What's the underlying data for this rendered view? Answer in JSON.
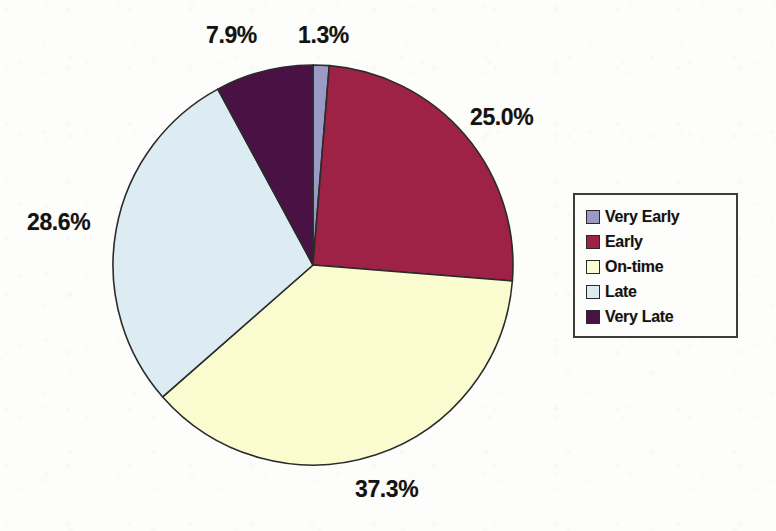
{
  "chart_data": {
    "type": "pie",
    "title": "",
    "subtitle": "",
    "xlabel": "",
    "ylabel": "",
    "legend_position": "right",
    "grid": false,
    "start_angle_deg": 0,
    "direction": "clockwise",
    "units": "percent",
    "categories": [
      "Very Early",
      "Early",
      "On-time",
      "Late",
      "Very Late"
    ],
    "values": [
      1.3,
      25.0,
      37.3,
      28.6,
      7.9
    ],
    "labels": [
      "1.3%",
      "25.0%",
      "37.3%",
      "28.6%",
      "7.9%"
    ],
    "colors": [
      "#9a9ac4",
      "#9e2245",
      "#fbfbd0",
      "#dcecf2",
      "#4a1145"
    ],
    "slices": [
      {
        "name": "Very Early",
        "value": 1.3,
        "label": "1.3%",
        "color": "#9a9ac4"
      },
      {
        "name": "Early",
        "value": 25.0,
        "label": "25.0%",
        "color": "#9e2245"
      },
      {
        "name": "On-time",
        "value": 37.3,
        "label": "37.3%",
        "color": "#fbfbd0"
      },
      {
        "name": "Late",
        "value": 28.6,
        "label": "28.6%",
        "color": "#dcecf2"
      },
      {
        "name": "Very Late",
        "value": 7.9,
        "label": "7.9%",
        "color": "#4a1145"
      }
    ],
    "geometry": {
      "cx": 313,
      "cy": 265,
      "r": 200
    },
    "label_positions": [
      {
        "label": "1.3%",
        "left": 298,
        "top": 22
      },
      {
        "label": "25.0%",
        "left": 470,
        "top": 104
      },
      {
        "label": "37.3%",
        "left": 355,
        "top": 476
      },
      {
        "label": "28.6%",
        "left": 27,
        "top": 209
      },
      {
        "label": "7.9%",
        "left": 206,
        "top": 22
      }
    ]
  },
  "legend": {
    "items": [
      {
        "label": "Very Early",
        "color": "#9a9ac4"
      },
      {
        "label": "Early",
        "color": "#9e2245"
      },
      {
        "label": "On-time",
        "color": "#fbfbd0"
      },
      {
        "label": "Late",
        "color": "#dcecf2"
      },
      {
        "label": "Very Late",
        "color": "#4a1145"
      }
    ]
  },
  "style": {
    "background": "#fdfdfb",
    "slice_outline": "#2b2b2b",
    "text_color": "#15120f",
    "legend_border": "#3d3d3d"
  }
}
